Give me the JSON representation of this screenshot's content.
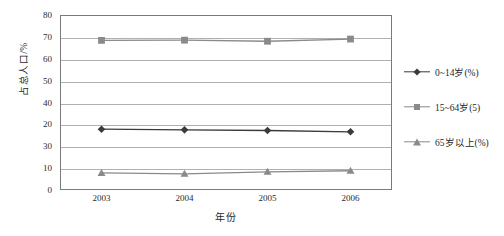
{
  "chart_data": {
    "type": "line",
    "title": "",
    "subtitle": "",
    "xlabel": "年份",
    "ylabel": "占总人口/%",
    "categories": [
      "2003",
      "2004",
      "2005",
      "2006"
    ],
    "x": [
      2003,
      2004,
      2005,
      2006
    ],
    "ylim": [
      0,
      80
    ],
    "y_ticks_numeric": [
      0,
      10,
      20,
      30,
      40,
      50,
      60,
      70,
      80
    ],
    "y_tick_labels": [
      "0",
      "10",
      "30",
      "20",
      "40",
      "50",
      "60",
      "70",
      "80"
    ],
    "grid": true,
    "legend_position": "right",
    "series": [
      {
        "name": "0~14岁(%)",
        "marker": "diamond",
        "color": "#3a3a3a",
        "values": [
          27.8,
          27.5,
          27.2,
          26.6
        ]
      },
      {
        "name": "15~64岁(5)",
        "marker": "square",
        "color": "#8a8a8a",
        "values": [
          68.4,
          68.5,
          68.0,
          69.0
        ]
      },
      {
        "name": "65岁以上(%)",
        "marker": "triangle",
        "color": "#8a8a8a",
        "values": [
          7.8,
          7.4,
          8.3,
          8.8
        ]
      }
    ]
  },
  "axes": {
    "y_title": "占总人口/%",
    "x_title": "年份"
  },
  "legend": {
    "entries": [
      {
        "label": "0~14岁(%)"
      },
      {
        "label": "15~64岁(5)"
      },
      {
        "label": "65岁以上(%)"
      }
    ]
  }
}
